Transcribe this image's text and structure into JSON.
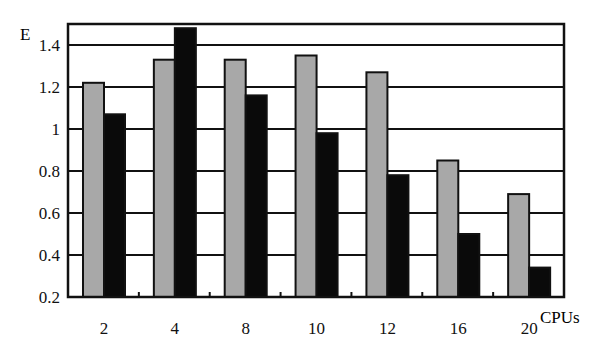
{
  "chart_data": {
    "type": "bar",
    "title": "",
    "xlabel": "CPUs",
    "ylabel": "E",
    "categories": [
      "2",
      "4",
      "8",
      "10",
      "12",
      "16",
      "20"
    ],
    "series": [
      {
        "name": "Series 1 (gray)",
        "color": "#a8a8a8",
        "values": [
          1.22,
          1.33,
          1.33,
          1.35,
          1.27,
          0.85,
          0.69
        ]
      },
      {
        "name": "Series 2 (black)",
        "color": "#0a0a0a",
        "values": [
          1.07,
          1.48,
          1.16,
          0.98,
          0.78,
          0.5,
          0.34
        ]
      }
    ],
    "ylim": [
      0.2,
      1.5
    ],
    "yticks": [
      "0.2",
      "0.4",
      "0.6",
      "0.8",
      "1",
      "1.2",
      "1.4"
    ],
    "grid": true,
    "legend": "none"
  }
}
